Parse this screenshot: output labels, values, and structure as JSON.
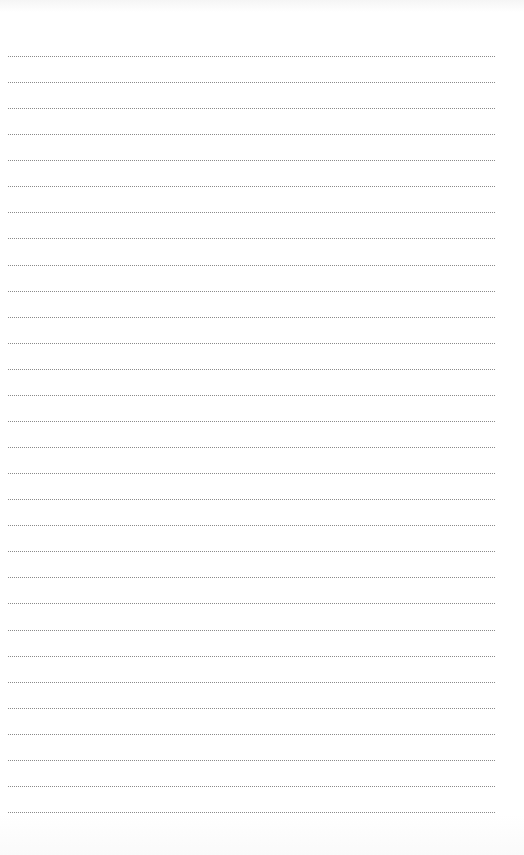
{
  "page": {
    "type": "lined-notebook-page",
    "background_color": "#ffffff",
    "rules": {
      "count": 30,
      "style": "dotted",
      "color": "#8a8a8a",
      "first_y": 56,
      "spacing": 26.07,
      "left_x": 8,
      "right_x": 496
    },
    "text_content": []
  }
}
